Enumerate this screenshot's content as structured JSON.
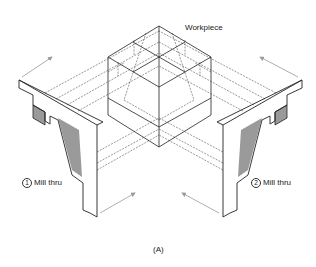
{
  "diagram": {
    "workpiece_label": "Workpiece",
    "left_op": {
      "number": "1",
      "label": "Mill thru"
    },
    "right_op": {
      "number": "2",
      "label": "Mill thru"
    },
    "caption": "(A)"
  },
  "colors": {
    "line": "#222222",
    "shade": "#9a9a9a",
    "arrow": "#9a9a9a"
  }
}
